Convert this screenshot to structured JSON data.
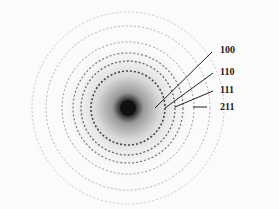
{
  "figure": {
    "type": "electron diffraction ring pattern",
    "labels": [
      {
        "text": "100"
      },
      {
        "text": "110"
      },
      {
        "text": "111"
      },
      {
        "text": "211"
      }
    ]
  }
}
